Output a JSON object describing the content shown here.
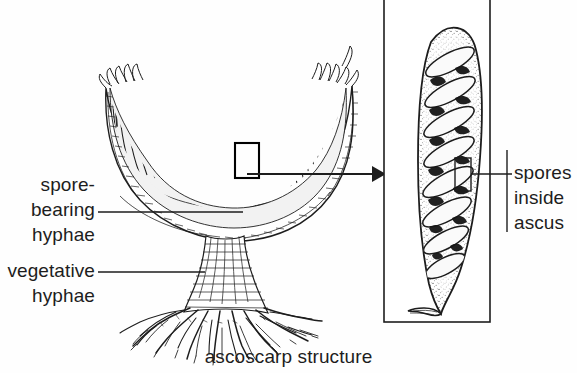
{
  "figure": {
    "title": "ascoscarp structure",
    "background_color": "#fefefe",
    "ink_color": "#1d1d1d",
    "labels": {
      "spore_bearing": {
        "line1": "spore-",
        "line2": "bearing",
        "line3": "hyphae"
      },
      "vegetative": {
        "line1": "vegetative",
        "line2": "hyphae"
      },
      "spores_inside_ascus": {
        "line1": "spores",
        "line2": "inside",
        "line3": "ascus"
      }
    },
    "caption": "ascoscarp structure",
    "parts": {
      "ascocarp": "cup-shaped-apothecium",
      "hymenium": "palisade-layer-of-asci",
      "stalk": "vegetative-stipe",
      "rhizoids": "root-like-hyphae",
      "inset_panel": "magnified-ascus",
      "ascus": "elongated-sac",
      "spore_count": 8
    }
  }
}
